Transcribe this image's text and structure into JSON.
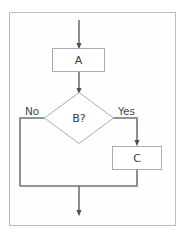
{
  "canvas": {
    "width": 185,
    "height": 237,
    "background": "#ffffff"
  },
  "frame": {
    "name": "diagram-frame",
    "x": 9,
    "y": 12,
    "width": 167,
    "height": 214,
    "stroke": "#b9bdc2",
    "fill": "#fefefe"
  },
  "style": {
    "node_stroke": "#a9adb2",
    "node_fill": "#ffffff",
    "connector_color": "#6f7276",
    "text_color": "#3a3a3a",
    "label_color": "#4a4a4a"
  },
  "diagram": {
    "type": "flowchart",
    "title": "",
    "nodes": [
      {
        "id": "start",
        "shape": "arrow-entry",
        "label": "",
        "x": 79,
        "y": 20
      },
      {
        "id": "A",
        "shape": "rectangle",
        "label": "A",
        "x": 52,
        "y": 48,
        "width": 53,
        "height": 24,
        "cx": 78.5,
        "cy": 60
      },
      {
        "id": "B",
        "shape": "diamond",
        "label": "B?",
        "cx": 79,
        "cy": 118,
        "half_width": 35,
        "half_height": 26
      },
      {
        "id": "C",
        "shape": "rectangle",
        "label": "C",
        "x": 112,
        "y": 146,
        "width": 50,
        "height": 24,
        "cx": 137,
        "cy": 158
      },
      {
        "id": "end",
        "shape": "arrow-exit",
        "label": "",
        "x": 79,
        "y": 215
      }
    ],
    "edges": [
      {
        "id": "edge-start-A",
        "from": "start",
        "to": "A",
        "label": "",
        "points": "79,20 79,46"
      },
      {
        "id": "edge-A-B",
        "from": "A",
        "to": "B",
        "label": "",
        "points": "79,72 79,91"
      },
      {
        "id": "edge-B-no",
        "from": "B",
        "to": "merge",
        "label": "No",
        "label_x": 25,
        "label_y": 112,
        "points": "44,118 20,118 20,186"
      },
      {
        "id": "edge-B-yes",
        "from": "B",
        "to": "C",
        "label": "Yes",
        "label_x": 118,
        "label_y": 112,
        "points": "114,118 137,118 137,144"
      },
      {
        "id": "edge-C-merge",
        "from": "C",
        "to": "merge",
        "label": "",
        "points": "137,170 137,186 20,186"
      },
      {
        "id": "edge-merge-end",
        "from": "merge",
        "to": "end",
        "label": "",
        "points": "79,186 79,213"
      }
    ],
    "merge_point": {
      "x": 79,
      "y": 186
    }
  }
}
